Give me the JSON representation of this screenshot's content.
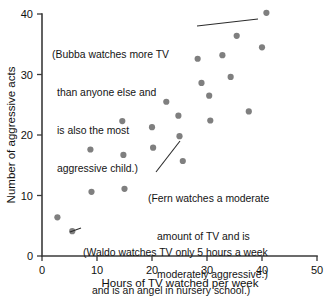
{
  "chart_data": {
    "type": "scatter",
    "title": "",
    "xlabel": "Hours of TV watched per week",
    "ylabel": "Number of aggressive acts",
    "xlim": [
      0,
      50
    ],
    "ylim": [
      0,
      40
    ],
    "xticks": [
      "0",
      "10",
      "20",
      "30",
      "40",
      "50"
    ],
    "yticks": [
      "0",
      "10",
      "20",
      "30",
      "40"
    ],
    "grid": false,
    "legend": "none",
    "series": [
      {
        "name": "children",
        "points": [
          {
            "x": 2.8,
            "y": 6.4
          },
          {
            "x": 5.5,
            "y": 4.1
          },
          {
            "x": 8.8,
            "y": 17.6
          },
          {
            "x": 9.0,
            "y": 10.6
          },
          {
            "x": 14.6,
            "y": 22.3
          },
          {
            "x": 14.8,
            "y": 16.7
          },
          {
            "x": 15.0,
            "y": 11.1
          },
          {
            "x": 20.0,
            "y": 21.3
          },
          {
            "x": 20.2,
            "y": 17.9
          },
          {
            "x": 22.6,
            "y": 25.5
          },
          {
            "x": 24.8,
            "y": 23.2
          },
          {
            "x": 25.0,
            "y": 19.8
          },
          {
            "x": 25.6,
            "y": 15.7
          },
          {
            "x": 28.3,
            "y": 32.6
          },
          {
            "x": 29.0,
            "y": 28.6
          },
          {
            "x": 30.4,
            "y": 26.5
          },
          {
            "x": 30.6,
            "y": 22.4
          },
          {
            "x": 32.8,
            "y": 33.2
          },
          {
            "x": 34.3,
            "y": 29.6
          },
          {
            "x": 35.4,
            "y": 36.4
          },
          {
            "x": 37.6,
            "y": 23.9
          },
          {
            "x": 40.0,
            "y": 34.5
          },
          {
            "x": 40.8,
            "y": 40.2
          }
        ]
      }
    ],
    "annotations": [
      {
        "id": "bubba",
        "lines": [
          "(Bubba watches more TV",
          "than anyone else and",
          "is also the most",
          "aggressive child.)"
        ],
        "target_point": {
          "x": 40.8,
          "y": 40.2
        }
      },
      {
        "id": "fern",
        "lines": [
          "(Fern watches a moderate",
          "amount of TV and is",
          "moderately aggressive.)"
        ],
        "target_point": {
          "x": 25.0,
          "y": 19.8
        }
      },
      {
        "id": "waldo",
        "lines": [
          "(Waldo watches TV only 5 hours a week",
          "and is an angel in nursery school.)"
        ],
        "target_point": {
          "x": 5.5,
          "y": 4.1
        }
      }
    ],
    "colors": {
      "point": "#7f7f7f",
      "axis": "#3a3a3a",
      "text": "#141414",
      "background": "#ffffff"
    }
  }
}
